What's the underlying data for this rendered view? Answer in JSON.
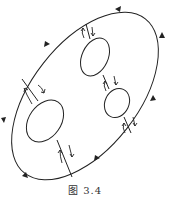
{
  "figure": {
    "caption": "图 3.4",
    "stroke_color": "#222222"
  },
  "outer_boundary": {
    "cx": 85,
    "cy": 96,
    "rx": 95,
    "ry": 52,
    "rotate": -52,
    "arrow_direction": "counterclockwise"
  },
  "holes": [
    {
      "id": "upper",
      "cx": 95,
      "cy": 57,
      "rx": 13,
      "ry": 19,
      "rotate": 20
    },
    {
      "id": "right",
      "cx": 117,
      "cy": 103,
      "rx": 12,
      "ry": 15,
      "rotate": 20
    },
    {
      "id": "lower-left",
      "cx": 45,
      "cy": 121,
      "rx": 16,
      "ry": 23,
      "rotate": 30
    }
  ],
  "cuts": [
    {
      "id": "outer-upper",
      "x1": 86,
      "y1": 24,
      "x2": 90,
      "y2": 40
    },
    {
      "id": "upper-right",
      "x1": 103,
      "y1": 74,
      "x2": 109,
      "y2": 89
    },
    {
      "id": "right-outer",
      "x1": 123,
      "y1": 117,
      "x2": 131,
      "y2": 133
    },
    {
      "id": "outer-lowerleft",
      "x1": 22,
      "y1": 79,
      "x2": 38,
      "y2": 100
    },
    {
      "id": "lowerleft-outer",
      "x1": 56,
      "y1": 141,
      "x2": 72,
      "y2": 176
    }
  ]
}
